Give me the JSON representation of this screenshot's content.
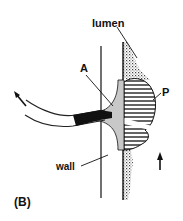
{
  "figure": {
    "panel_label": "(B)",
    "labels": {
      "lumen": "lumen",
      "a": "A",
      "p": "P",
      "wall": "wall"
    },
    "colors": {
      "ink": "#111111",
      "grey_fill": "#c8c8c8",
      "background": "#ffffff"
    }
  }
}
